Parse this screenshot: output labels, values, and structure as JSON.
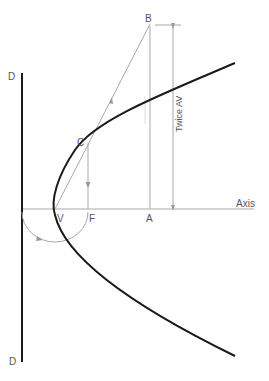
{
  "diagram": {
    "type": "parabola-construction",
    "labels": {
      "directrix_top": "D",
      "directrix_bottom": "D",
      "point_b": "B",
      "point_c": "C",
      "vertex": "V",
      "focus": "F",
      "point_a": "A",
      "axis": "Axis",
      "dimension": "Twice AV"
    },
    "colors": {
      "curve": "#1a1a1a",
      "directrix": "#1a1a1a",
      "construction": "#9a9a9a",
      "text": "#555555",
      "background": "#ffffff"
    }
  }
}
